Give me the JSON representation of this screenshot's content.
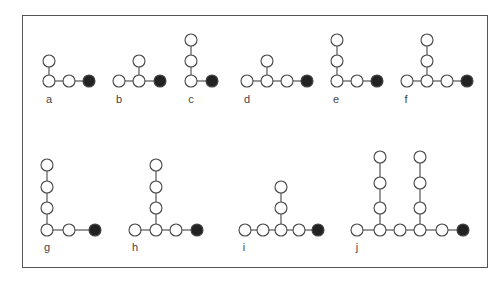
{
  "figure": {
    "node_radius": 6,
    "colors": {
      "open_fill": "#ffffff",
      "terminal_fill": "#222222",
      "stroke": "#444444",
      "frame": "#555555"
    },
    "panels": [
      {
        "id": "a",
        "label": "a",
        "label_pos": [
          49,
          103
        ],
        "nodes": [
          [
            49,
            81,
            "open"
          ],
          [
            69,
            81,
            "open"
          ],
          [
            89,
            81,
            "filled"
          ],
          [
            49,
            61,
            "open"
          ]
        ],
        "edges": [
          [
            0,
            1
          ],
          [
            1,
            2
          ],
          [
            0,
            3
          ]
        ]
      },
      {
        "id": "b",
        "label": "b",
        "label_pos": [
          119,
          103
        ],
        "nodes": [
          [
            119,
            81,
            "open"
          ],
          [
            139,
            81,
            "open"
          ],
          [
            160,
            81,
            "filled"
          ],
          [
            139,
            61,
            "open"
          ]
        ],
        "edges": [
          [
            0,
            1
          ],
          [
            1,
            2
          ],
          [
            1,
            3
          ]
        ]
      },
      {
        "id": "c",
        "label": "c",
        "label_pos": [
          191,
          103
        ],
        "nodes": [
          [
            191,
            81,
            "open"
          ],
          [
            212,
            81,
            "filled"
          ],
          [
            191,
            61,
            "open"
          ],
          [
            191,
            40,
            "open"
          ]
        ],
        "edges": [
          [
            0,
            1
          ],
          [
            0,
            2
          ],
          [
            2,
            3
          ]
        ]
      },
      {
        "id": "d",
        "label": "d",
        "label_pos": [
          247,
          103
        ],
        "nodes": [
          [
            247,
            81,
            "open"
          ],
          [
            267,
            81,
            "open"
          ],
          [
            287,
            81,
            "open"
          ],
          [
            307,
            81,
            "filled"
          ],
          [
            267,
            61,
            "open"
          ]
        ],
        "edges": [
          [
            0,
            1
          ],
          [
            1,
            2
          ],
          [
            2,
            3
          ],
          [
            1,
            4
          ]
        ]
      },
      {
        "id": "e",
        "label": "e",
        "label_pos": [
          336,
          103
        ],
        "nodes": [
          [
            337,
            81,
            "open"
          ],
          [
            357,
            81,
            "open"
          ],
          [
            377,
            81,
            "filled"
          ],
          [
            337,
            61,
            "open"
          ],
          [
            337,
            40,
            "open"
          ]
        ],
        "edges": [
          [
            0,
            1
          ],
          [
            1,
            2
          ],
          [
            0,
            3
          ],
          [
            3,
            4
          ]
        ]
      },
      {
        "id": "f",
        "label": "f",
        "label_pos": [
          406,
          103
        ],
        "nodes": [
          [
            407,
            81,
            "open"
          ],
          [
            427,
            81,
            "open"
          ],
          [
            447,
            81,
            "open"
          ],
          [
            467,
            81,
            "filled"
          ],
          [
            427,
            61,
            "open"
          ],
          [
            427,
            40,
            "open"
          ]
        ],
        "edges": [
          [
            0,
            1
          ],
          [
            1,
            2
          ],
          [
            2,
            3
          ],
          [
            1,
            4
          ],
          [
            4,
            5
          ]
        ]
      },
      {
        "id": "g",
        "label": "g",
        "label_pos": [
          47,
          251
        ],
        "nodes": [
          [
            47,
            230,
            "open"
          ],
          [
            69,
            230,
            "open"
          ],
          [
            95,
            230,
            "filled"
          ],
          [
            47,
            208,
            "open"
          ],
          [
            47,
            187,
            "open"
          ],
          [
            47,
            165,
            "open"
          ]
        ],
        "edges": [
          [
            0,
            1
          ],
          [
            1,
            2
          ],
          [
            0,
            3
          ],
          [
            3,
            4
          ],
          [
            4,
            5
          ]
        ]
      },
      {
        "id": "h",
        "label": "h",
        "label_pos": [
          135,
          251
        ],
        "nodes": [
          [
            135,
            230,
            "open"
          ],
          [
            156,
            230,
            "open"
          ],
          [
            176,
            230,
            "open"
          ],
          [
            197,
            230,
            "filled"
          ],
          [
            156,
            208,
            "open"
          ],
          [
            156,
            187,
            "open"
          ],
          [
            156,
            165,
            "open"
          ]
        ],
        "edges": [
          [
            0,
            1
          ],
          [
            1,
            2
          ],
          [
            2,
            3
          ],
          [
            1,
            4
          ],
          [
            4,
            5
          ],
          [
            5,
            6
          ]
        ]
      },
      {
        "id": "i",
        "label": "i",
        "label_pos": [
          244,
          251
        ],
        "nodes": [
          [
            245,
            230,
            "open"
          ],
          [
            263,
            230,
            "open"
          ],
          [
            281,
            230,
            "open"
          ],
          [
            299,
            230,
            "open"
          ],
          [
            318,
            230,
            "filled"
          ],
          [
            281,
            208,
            "open"
          ],
          [
            281,
            187,
            "open"
          ]
        ],
        "edges": [
          [
            0,
            1
          ],
          [
            1,
            2
          ],
          [
            2,
            3
          ],
          [
            3,
            4
          ],
          [
            2,
            5
          ],
          [
            5,
            6
          ]
        ]
      },
      {
        "id": "j",
        "label": "j",
        "label_pos": [
          357,
          251
        ],
        "nodes": [
          [
            357,
            230,
            "open"
          ],
          [
            380,
            230,
            "open"
          ],
          [
            400,
            230,
            "open"
          ],
          [
            420,
            230,
            "open"
          ],
          [
            442,
            230,
            "open"
          ],
          [
            463,
            230,
            "filled"
          ],
          [
            380,
            208,
            "open"
          ],
          [
            380,
            183,
            "open"
          ],
          [
            380,
            157,
            "open"
          ],
          [
            420,
            208,
            "open"
          ],
          [
            420,
            183,
            "open"
          ],
          [
            420,
            157,
            "open"
          ]
        ],
        "edges": [
          [
            0,
            1
          ],
          [
            1,
            2
          ],
          [
            2,
            3
          ],
          [
            3,
            4
          ],
          [
            4,
            5
          ],
          [
            1,
            6
          ],
          [
            6,
            7
          ],
          [
            7,
            8
          ],
          [
            3,
            9
          ],
          [
            9,
            10
          ],
          [
            10,
            11
          ]
        ]
      }
    ]
  }
}
